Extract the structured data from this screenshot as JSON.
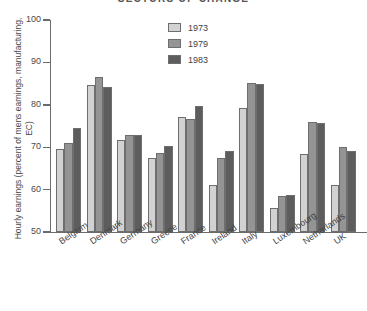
{
  "chart_data": {
    "type": "bar",
    "title": "SECTORS OF CHANGE",
    "xlabel": "",
    "ylabel": "Hourly earnings (percent of mens earnings, manufacturing, EC)",
    "ylim": [
      50,
      100
    ],
    "yticks": [
      50,
      60,
      70,
      80,
      90,
      100
    ],
    "grid": false,
    "legend_position": "top-center",
    "categories": [
      "Belgium",
      "Denmark",
      "Germany",
      "Greece",
      "France",
      "Ireland",
      "Italy",
      "Luxembourg",
      "Netherlands",
      "UK"
    ],
    "series": [
      {
        "name": "1973",
        "color": "#d2d2d2",
        "values": [
          69.6,
          84.6,
          71.8,
          67.5,
          77.2,
          61.1,
          79.2,
          55.6,
          68.3,
          61.2
        ]
      },
      {
        "name": "1979",
        "color": "#949494",
        "values": [
          70.9,
          86.5,
          72.9,
          68.7,
          76.7,
          67.4,
          85.2,
          58.4,
          76.0,
          70.0
        ]
      },
      {
        "name": "1983",
        "color": "#5d5d5d",
        "values": [
          74.5,
          84.3,
          72.8,
          70.2,
          79.8,
          69.0,
          84.8,
          58.7,
          75.7,
          69.2
        ]
      }
    ]
  },
  "legend": {
    "entries": [
      {
        "label": "1973"
      },
      {
        "label": "1979"
      },
      {
        "label": "1983"
      }
    ]
  }
}
